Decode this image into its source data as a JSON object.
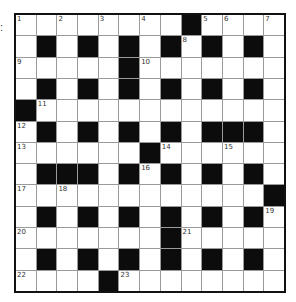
{
  "label": ":",
  "crossword": {
    "rows": 13,
    "cols": 13,
    "colors": {
      "white": "#ffffff",
      "black": "#0c0c0c",
      "gridline": "#9a9a9a",
      "border": "#111111",
      "number": "#333333"
    },
    "layout": [
      "........#....",
      ".#.#.#.#.#.#.",
      ".....#.......",
      ".#.#.#.#.#.#.",
      "#............",
      ".#.#.#.#.###.",
      "......#......",
      ".###.#.#.#.#.",
      "............#",
      ".#.#.#.#.#.#.",
      ".......#.....",
      ".#.#.#.#.#.#.",
      "....#........"
    ],
    "numbers": [
      {
        "row": 0,
        "col": 0,
        "n": "1"
      },
      {
        "row": 0,
        "col": 2,
        "n": "2"
      },
      {
        "row": 0,
        "col": 4,
        "n": "3"
      },
      {
        "row": 0,
        "col": 6,
        "n": "4"
      },
      {
        "row": 0,
        "col": 9,
        "n": "5"
      },
      {
        "row": 0,
        "col": 10,
        "n": "6"
      },
      {
        "row": 0,
        "col": 12,
        "n": "7"
      },
      {
        "row": 1,
        "col": 8,
        "n": "8"
      },
      {
        "row": 2,
        "col": 0,
        "n": "9"
      },
      {
        "row": 2,
        "col": 6,
        "n": "10"
      },
      {
        "row": 4,
        "col": 1,
        "n": "11"
      },
      {
        "row": 5,
        "col": 0,
        "n": "12"
      },
      {
        "row": 6,
        "col": 0,
        "n": "13"
      },
      {
        "row": 6,
        "col": 7,
        "n": "14"
      },
      {
        "row": 6,
        "col": 10,
        "n": "15"
      },
      {
        "row": 7,
        "col": 6,
        "n": "16"
      },
      {
        "row": 8,
        "col": 0,
        "n": "17"
      },
      {
        "row": 8,
        "col": 2,
        "n": "18"
      },
      {
        "row": 9,
        "col": 12,
        "n": "19"
      },
      {
        "row": 10,
        "col": 0,
        "n": "20"
      },
      {
        "row": 10,
        "col": 8,
        "n": "21"
      },
      {
        "row": 12,
        "col": 0,
        "n": "22"
      },
      {
        "row": 12,
        "col": 5,
        "n": "23"
      }
    ]
  }
}
